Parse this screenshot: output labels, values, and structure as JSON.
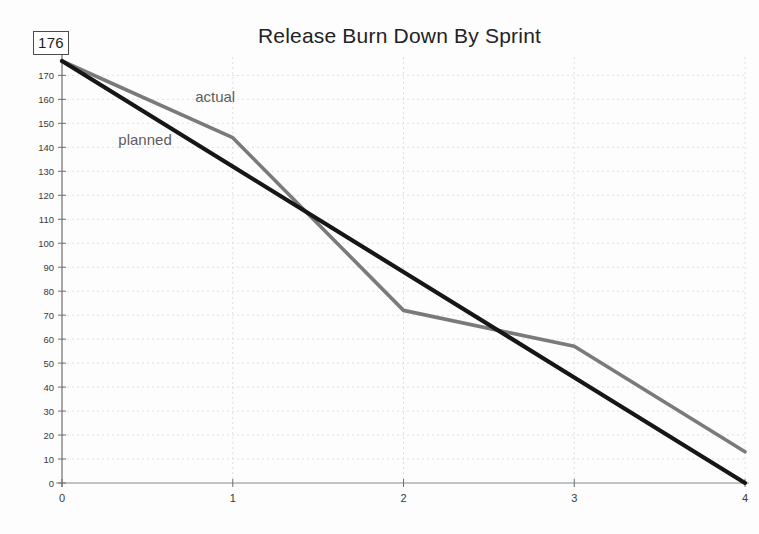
{
  "chart": {
    "title": "Release Burn Down By Sprint",
    "max_value_badge": "176"
  },
  "chart_data": {
    "type": "line",
    "title": "Release Burn Down By Sprint",
    "xlabel": "",
    "ylabel": "",
    "xlim": [
      0,
      4
    ],
    "ylim": [
      0,
      176
    ],
    "grid": true,
    "legend_position": "inline-annotation",
    "x": [
      0,
      1,
      2,
      3,
      4
    ],
    "x_tick_labels": [
      "0",
      "1",
      "2",
      "3",
      "4"
    ],
    "y_tick_labels": [
      "0",
      "10",
      "20",
      "30",
      "40",
      "50",
      "60",
      "70",
      "80",
      "90",
      "100",
      "110",
      "120",
      "130",
      "140",
      "150",
      "160",
      "170"
    ],
    "y_ticks": [
      0,
      10,
      20,
      30,
      40,
      50,
      60,
      70,
      80,
      90,
      100,
      110,
      120,
      130,
      140,
      150,
      160,
      170
    ],
    "annotations": [
      {
        "text": "actual",
        "x": 0.78,
        "y": 159
      },
      {
        "text": "planned",
        "x": 0.33,
        "y": 141
      }
    ],
    "series": [
      {
        "name": "actual",
        "color": "#7a7a7a",
        "values": [
          176,
          144,
          72,
          57,
          13
        ]
      },
      {
        "name": "planned",
        "color": "#161616",
        "values": [
          176,
          132,
          88,
          44,
          0
        ]
      }
    ]
  },
  "colors": {
    "actual": "#7a7a7a",
    "planned": "#161616",
    "axis": "#6f6f6f",
    "grid": "#d8d8d8",
    "text": "#3a3a3a"
  }
}
